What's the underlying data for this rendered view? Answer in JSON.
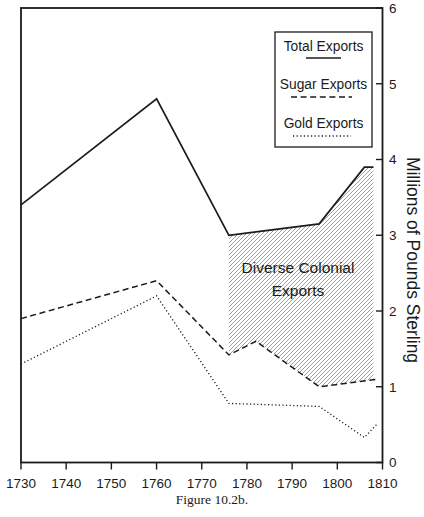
{
  "figure": {
    "caption": "Figure 10.2b.",
    "background": "#ffffff",
    "ink": "#1b1b1b",
    "hatch_color": "#8f8f8f"
  },
  "chart_data": {
    "type": "line",
    "title": "",
    "x_axis": {
      "label": "",
      "range": [
        1730,
        1810
      ],
      "ticks": [
        1730,
        1740,
        1750,
        1760,
        1770,
        1780,
        1790,
        1800,
        1810
      ]
    },
    "y_axis": {
      "label": "Millions of Pounds Sterling",
      "range": [
        0,
        6
      ],
      "ticks": [
        0,
        1,
        2,
        3,
        4,
        5,
        6
      ],
      "side": "right"
    },
    "legend": {
      "position": "top-right-inside",
      "border": true
    },
    "series": [
      {
        "name": "Total Exports",
        "style": "solid",
        "points": [
          [
            1730,
            3.4
          ],
          [
            1760,
            4.8
          ],
          [
            1776,
            3.0
          ],
          [
            1796,
            3.15
          ],
          [
            1806,
            3.9
          ],
          [
            1808,
            3.9
          ]
        ]
      },
      {
        "name": "Sugar Exports",
        "style": "dashed",
        "points": [
          [
            1730,
            1.9
          ],
          [
            1760,
            2.4
          ],
          [
            1776,
            1.42
          ],
          [
            1782,
            1.6
          ],
          [
            1796,
            1.0
          ],
          [
            1809,
            1.1
          ]
        ]
      },
      {
        "name": "Gold Exports",
        "style": "dotted",
        "points": [
          [
            1730,
            1.3
          ],
          [
            1760,
            2.2
          ],
          [
            1776,
            0.78
          ],
          [
            1796,
            0.74
          ],
          [
            1806,
            0.33
          ],
          [
            1809,
            0.52
          ]
        ]
      }
    ],
    "region": {
      "label_lines": [
        "Diverse Colonial",
        "Exports"
      ],
      "fill": "diagonal-hatch",
      "meaning": "gap between Total Exports and Sugar Exports after 1776",
      "polygon": [
        [
          1776,
          3.0
        ],
        [
          1796,
          3.15
        ],
        [
          1806,
          3.9
        ],
        [
          1808,
          3.9
        ],
        [
          1808,
          1.095
        ],
        [
          1796,
          1.0
        ],
        [
          1782,
          1.6
        ],
        [
          1776,
          1.42
        ]
      ]
    }
  }
}
